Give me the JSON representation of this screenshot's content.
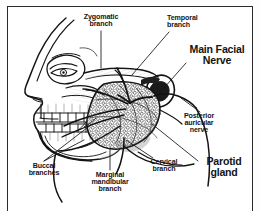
{
  "figure": {
    "background_color": "#fdfdfd",
    "border_color": "#2b2b2b",
    "ink_color": "#141414"
  },
  "labels": {
    "zygomatic_branch": "Zygomatic\nbranch",
    "temporal_branch": "Temporal\nbranch",
    "main_facial_nerve": "Main Facial\nNerve",
    "posterior_auricular_nerve": "Posterior\nauricular\nnerve",
    "parotid_gland": "Parotid\ngland",
    "cervical_branch": "Cervical\nbranch",
    "marginal_mandibular_branch": "Marginal\nmandibular\nbranch",
    "buccal_branches": "Buccal\nbranches"
  },
  "anatomy": {
    "structures": [
      "face-profile",
      "nose",
      "eye-orbit",
      "zygomatic-arch",
      "upper-teeth",
      "lower-teeth",
      "mandible",
      "ear",
      "parotid-gland-mass",
      "facial-nerve-trunk",
      "temporal-branch-nerve",
      "zygomatic-branch-nerve",
      "buccal-branch-nerve",
      "marginal-mandibular-branch-nerve",
      "cervical-branch-nerve",
      "posterior-auricular-nerve",
      "neck-contour"
    ]
  }
}
